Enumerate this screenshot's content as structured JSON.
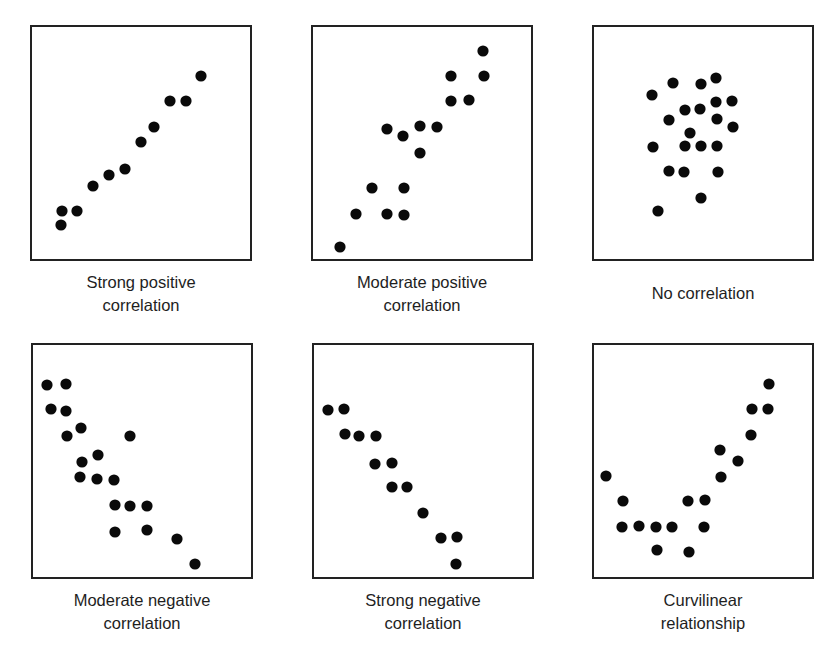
{
  "figure": {
    "panels": [
      {
        "id": "strong-positive",
        "label_line1": "Strong positive",
        "label_line2": "correlation"
      },
      {
        "id": "moderate-positive",
        "label_line1": "Moderate positive",
        "label_line2": "correlation"
      },
      {
        "id": "no-correlation",
        "label_line1": "No correlation",
        "label_line2": ""
      },
      {
        "id": "moderate-negative",
        "label_line1": "Moderate negative",
        "label_line2": "correlation"
      },
      {
        "id": "strong-negative",
        "label_line1": "Strong negative",
        "label_line2": "correlation"
      },
      {
        "id": "curvilinear",
        "label_line1": "Curvilinear",
        "label_line2": "relationship"
      }
    ],
    "colors": {
      "dot": "#0a0a0a",
      "border": "#222222",
      "text": "#1e1e1e",
      "background": "#ffffff"
    }
  },
  "chart_data": [
    {
      "type": "scatter",
      "title": "Strong positive correlation",
      "xlabel": "",
      "ylabel": "",
      "axes": "none (frame only)",
      "grid": false,
      "legend": "none",
      "box_px": [
        222,
        236
      ],
      "points_px": [
        [
          171,
          51
        ],
        [
          140,
          76
        ],
        [
          156,
          76
        ],
        [
          124,
          102
        ],
        [
          111,
          117
        ],
        [
          95,
          144
        ],
        [
          79,
          150
        ],
        [
          63,
          161
        ],
        [
          32,
          186
        ],
        [
          47,
          186
        ],
        [
          31,
          200
        ]
      ]
    },
    {
      "type": "scatter",
      "title": "Moderate positive correlation",
      "xlabel": "",
      "ylabel": "",
      "axes": "none (frame only)",
      "grid": false,
      "legend": "none",
      "box_px": [
        222,
        236
      ],
      "points_px": [
        [
          172,
          26
        ],
        [
          140,
          51
        ],
        [
          173,
          51
        ],
        [
          140,
          76
        ],
        [
          158,
          75
        ],
        [
          76,
          104
        ],
        [
          92,
          111
        ],
        [
          109,
          101
        ],
        [
          126,
          102
        ],
        [
          109,
          128
        ],
        [
          61,
          163
        ],
        [
          93,
          163
        ],
        [
          45,
          189
        ],
        [
          76,
          189
        ],
        [
          93,
          190
        ],
        [
          29,
          222
        ]
      ]
    },
    {
      "type": "scatter",
      "title": "No correlation",
      "xlabel": "",
      "ylabel": "",
      "axes": "none (frame only)",
      "grid": false,
      "legend": "none",
      "box_px": [
        222,
        236
      ],
      "points_px": [
        [
          124,
          53
        ],
        [
          81,
          58
        ],
        [
          109,
          59
        ],
        [
          60,
          70
        ],
        [
          124,
          77
        ],
        [
          140,
          76
        ],
        [
          93,
          85
        ],
        [
          108,
          84
        ],
        [
          77,
          95
        ],
        [
          125,
          94
        ],
        [
          141,
          102
        ],
        [
          98,
          108
        ],
        [
          61,
          122
        ],
        [
          93,
          121
        ],
        [
          109,
          121
        ],
        [
          125,
          121
        ],
        [
          77,
          146
        ],
        [
          92,
          147
        ],
        [
          126,
          147
        ],
        [
          109,
          173
        ],
        [
          66,
          186
        ]
      ]
    },
    {
      "type": "scatter",
      "title": "Moderate negative correlation",
      "xlabel": "",
      "ylabel": "",
      "axes": "none (frame only)",
      "grid": false,
      "legend": "none",
      "box_px": [
        222,
        236
      ],
      "points_px": [
        [
          16,
          42
        ],
        [
          35,
          41
        ],
        [
          20,
          66
        ],
        [
          35,
          68
        ],
        [
          50,
          85
        ],
        [
          36,
          93
        ],
        [
          99,
          93
        ],
        [
          67,
          112
        ],
        [
          51,
          119
        ],
        [
          49,
          134
        ],
        [
          66,
          136
        ],
        [
          83,
          137
        ],
        [
          84,
          162
        ],
        [
          99,
          163
        ],
        [
          116,
          163
        ],
        [
          84,
          189
        ],
        [
          116,
          187
        ],
        [
          146,
          196
        ],
        [
          164,
          221
        ]
      ]
    },
    {
      "type": "scatter",
      "title": "Strong negative correlation",
      "xlabel": "",
      "ylabel": "",
      "axes": "none (frame only)",
      "grid": false,
      "legend": "none",
      "box_px": [
        222,
        236
      ],
      "points_px": [
        [
          16,
          67
        ],
        [
          32,
          66
        ],
        [
          33,
          91
        ],
        [
          47,
          93
        ],
        [
          64,
          93
        ],
        [
          63,
          121
        ],
        [
          80,
          120
        ],
        [
          80,
          144
        ],
        [
          95,
          144
        ],
        [
          111,
          170
        ],
        [
          129,
          195
        ],
        [
          145,
          194
        ],
        [
          144,
          221
        ]
      ]
    },
    {
      "type": "scatter",
      "title": "Curvilinear relationship",
      "xlabel": "",
      "ylabel": "",
      "axes": "none (frame only)",
      "grid": false,
      "legend": "none",
      "box_px": [
        222,
        236
      ],
      "points_px": [
        [
          177,
          41
        ],
        [
          160,
          66
        ],
        [
          176,
          66
        ],
        [
          159,
          92
        ],
        [
          128,
          107
        ],
        [
          146,
          118
        ],
        [
          129,
          134
        ],
        [
          14,
          133
        ],
        [
          31,
          158
        ],
        [
          96,
          158
        ],
        [
          113,
          157
        ],
        [
          30,
          184
        ],
        [
          47,
          183
        ],
        [
          64,
          184
        ],
        [
          80,
          184
        ],
        [
          112,
          184
        ],
        [
          65,
          207
        ],
        [
          97,
          209
        ]
      ]
    }
  ]
}
